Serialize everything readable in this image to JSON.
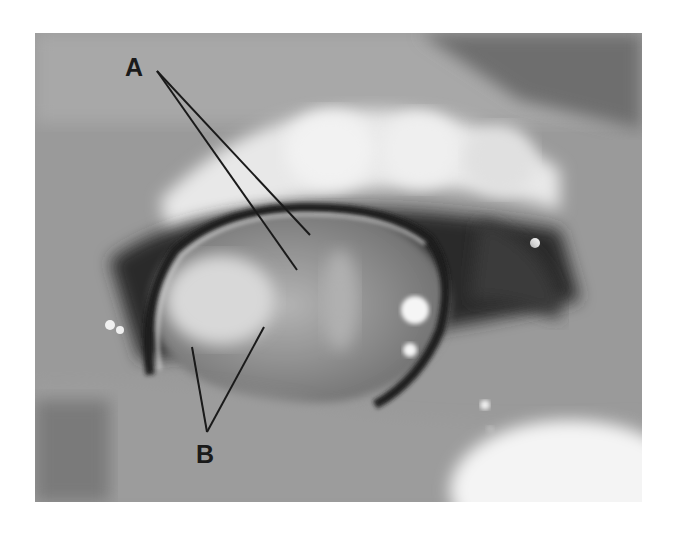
{
  "figure": {
    "labels": [
      {
        "id": "A",
        "text": "A",
        "x": 125,
        "y": 55,
        "pointers": [
          [
            308,
            235
          ],
          [
            297,
            270
          ]
        ]
      },
      {
        "id": "B",
        "text": "B",
        "x": 196,
        "y": 442,
        "pointers": [
          [
            192,
            347
          ],
          [
            264,
            327
          ]
        ]
      }
    ]
  }
}
